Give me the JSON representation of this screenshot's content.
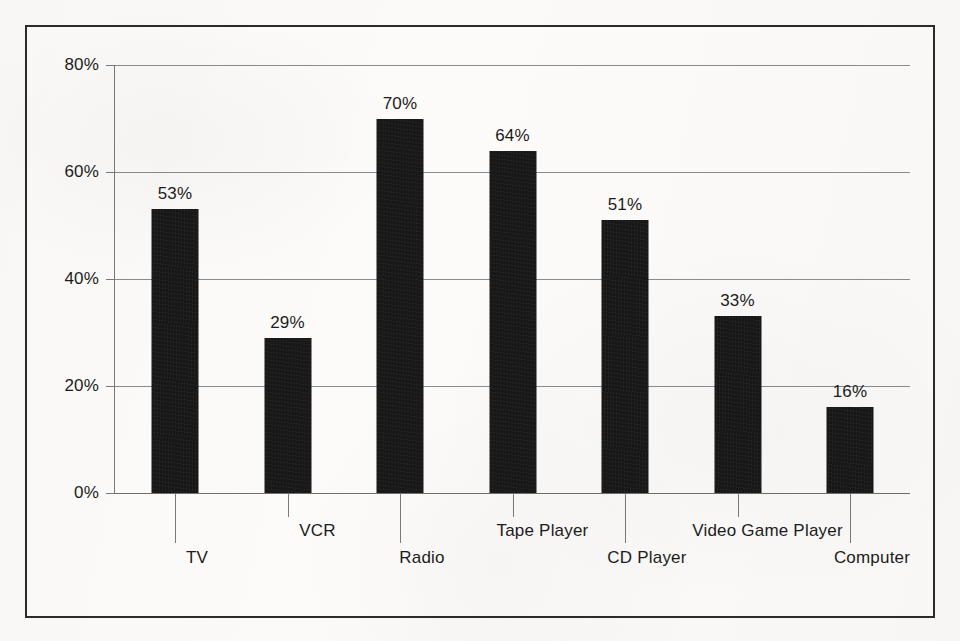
{
  "chart_data": {
    "type": "bar",
    "title": "",
    "subtitle": "",
    "xlabel": "",
    "ylabel": "",
    "categories": [
      "TV",
      "VCR",
      "Radio",
      "Tape Player",
      "CD Player",
      "Video Game Player",
      "Computer"
    ],
    "values": [
      53,
      29,
      70,
      64,
      51,
      33,
      16
    ],
    "value_labels": [
      "53%",
      "29%",
      "70%",
      "64%",
      "51%",
      "33%",
      "16%"
    ],
    "ylim": [
      0,
      80
    ],
    "ytick_values": [
      0,
      20,
      40,
      60,
      80
    ],
    "ytick_labels": [
      "0%",
      "20%",
      "40%",
      "60%",
      "80%"
    ],
    "grid": true,
    "grid_axis": "y",
    "legend": false,
    "legend_position": "none",
    "bar_color": "#161616",
    "gridline_color": "#8c8c8c",
    "axis_color": "#7a7a7a",
    "text_color": "#1c1c1c",
    "background_color": "#fcfbf9",
    "frame_color": "#2b2b2b",
    "label_layout": "staggered-two-rows",
    "label_rows": [
      "lower",
      "upper",
      "lower",
      "upper",
      "lower",
      "upper",
      "lower"
    ]
  }
}
